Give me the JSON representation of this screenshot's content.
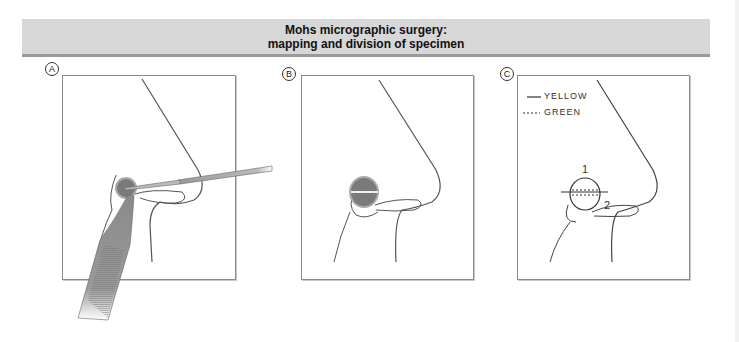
{
  "header": {
    "title_line1": "Mohs micrographic surgery:",
    "title_line2": "mapping and division of specimen",
    "background": "#d7d7d7",
    "underline": "#9a9a9a"
  },
  "panels": [
    {
      "label": "A",
      "description": "Scalpel excising lesion on nasal ala while forceps hold specimen"
    },
    {
      "label": "B",
      "description": "Excised site with specimen bisected by horizontal line"
    },
    {
      "label": "C",
      "description": "Specimen map with color-coded ink margins and numbered pieces",
      "legend": [
        {
          "style": "solid",
          "text": "YELLOW"
        },
        {
          "style": "dashed",
          "text": "GREEN"
        }
      ],
      "piece_numbers": [
        "1",
        "2"
      ]
    }
  ]
}
